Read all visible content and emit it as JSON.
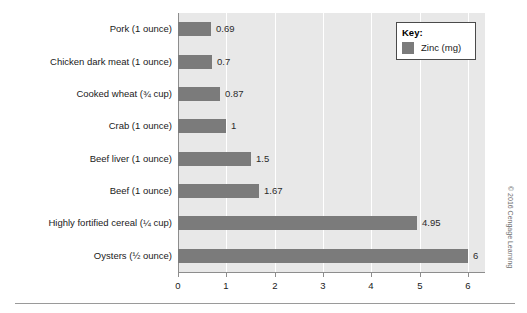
{
  "chart_data": {
    "type": "bar",
    "orientation": "horizontal",
    "title": "",
    "xlabel": "",
    "ylabel": "",
    "xlim": [
      0,
      6.35
    ],
    "xticks": [
      "0",
      "1",
      "2",
      "3",
      "4",
      "5",
      "6"
    ],
    "grid": "vertical-white-gridlines",
    "legend_position": "top-right",
    "categories": [
      "Pork (1 ounce)",
      "Chicken dark meat (1 ounce)",
      "Cooked wheat (¾ cup)",
      "Crab (1 ounce)",
      "Beef liver (1 ounce)",
      "Beef (1 ounce)",
      "Highly fortified cereal (¼ cup)",
      "Oysters (½ ounce)"
    ],
    "values": [
      0.69,
      0.7,
      0.87,
      1,
      1.5,
      1.67,
      4.95,
      6
    ],
    "value_labels": [
      "0.69",
      "0.7",
      "0.87",
      "1",
      "1.5",
      "1.67",
      "4.95",
      "6"
    ],
    "series": [
      {
        "name": "Zinc (mg)",
        "values": [
          0.69,
          0.7,
          0.87,
          1,
          1.5,
          1.67,
          4.95,
          6
        ]
      }
    ]
  },
  "legend": {
    "title": "Key:",
    "entries": [
      {
        "label": "Zinc (mg)",
        "color": "#7b7b7b"
      }
    ]
  },
  "colors": {
    "bar": "#7b7b7b",
    "plot_background": "#e8e8e8",
    "gridline": "#ffffff",
    "axis": "#8d8d8d",
    "page_background": "#ffffff"
  },
  "footer": {
    "copyright": "© 2016 Cengage Learning"
  }
}
